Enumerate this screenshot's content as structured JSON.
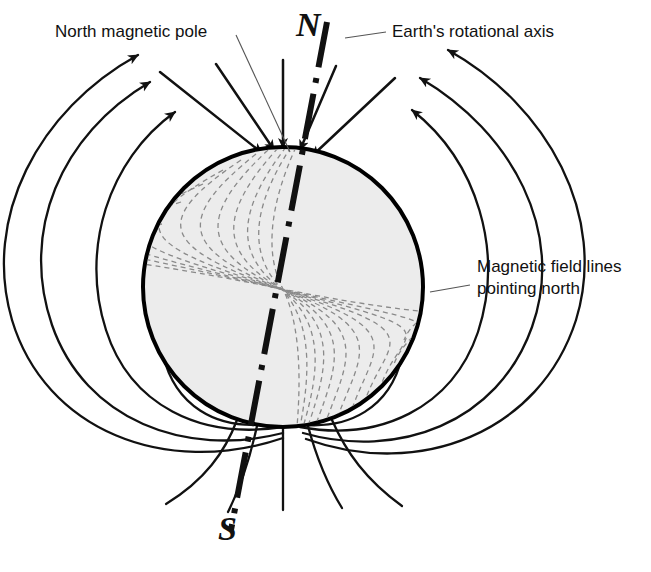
{
  "diagram": {
    "labels": {
      "north_magnetic_pole": "North magnetic pole",
      "rotational_axis": "Earth's rotational axis",
      "field_lines": "Magnetic field lines pointing north"
    },
    "pole_markers": {
      "north": "N",
      "south": "S"
    },
    "colors": {
      "background": "#ffffff",
      "ink": "#111111",
      "globe_fill": "#ececec",
      "globe_outline": "#000000",
      "interior_field_line": "#8a8a8a",
      "leader_line": "#555555"
    },
    "geometry": {
      "globe_center_x": 283,
      "globe_center_y": 287,
      "globe_radius": 140,
      "axis_tilt_degrees": 11
    },
    "icons": {
      "arrowhead": "field-arrow",
      "axis": "dash-dot-axis-line"
    }
  }
}
